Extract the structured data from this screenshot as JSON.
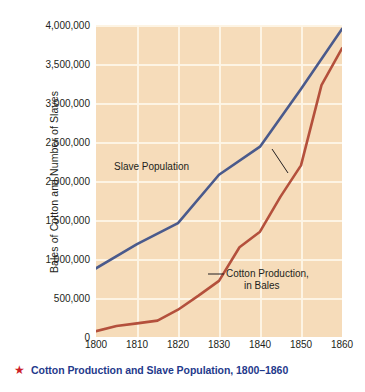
{
  "caption": {
    "star_icon": "★",
    "text": "Cotton Production and Slave Population, 1800–1860"
  },
  "annotations": {
    "slave_label": "Slave Population",
    "cotton_label_line1": "Cotton Production,",
    "cotton_label_line2": "in Bales"
  },
  "colors": {
    "plot_background": "#f6dcba",
    "gridline": "#fdf4e6",
    "slave_line": "#4a5a8c",
    "cotton_line": "#b4503c",
    "caption_text": "#1f3a8c",
    "caption_star": "#cc2027",
    "tick_text": "#231f20"
  },
  "chart_data": {
    "type": "line",
    "title": "Cotton Production and Slave Population, 1800–1860",
    "xlabel": "",
    "ylabel": "Bales of Cotton and Number of Slaves",
    "xlim": [
      1800,
      1860
    ],
    "ylim": [
      0,
      4000000
    ],
    "grid": true,
    "legend": "inline-annotations",
    "x": [
      1800,
      1810,
      1820,
      1830,
      1840,
      1850,
      1860
    ],
    "xticklabels": [
      "1800",
      "1810",
      "1820",
      "1830",
      "1840",
      "1850",
      "1860"
    ],
    "yticks": [
      0,
      500000,
      1000000,
      1500000,
      2000000,
      2500000,
      3000000,
      3500000,
      4000000
    ],
    "yticklabels": [
      "0",
      "500,000",
      "1,000,000",
      "1,500,000",
      "2,000,000",
      "2,500,000",
      "3,000,000",
      "3,500,000",
      "4,000,000"
    ],
    "series": [
      {
        "name": "Slave Population",
        "color": "#4a5a8c",
        "x": [
          1800,
          1810,
          1820,
          1830,
          1840,
          1850,
          1860
        ],
        "values": [
          880000,
          1190000,
          1460000,
          2080000,
          2440000,
          3180000,
          3950000
        ]
      },
      {
        "name": "Cotton Production, in Bales",
        "color": "#b4503c",
        "x": [
          1800,
          1805,
          1810,
          1815,
          1820,
          1825,
          1830,
          1835,
          1840,
          1845,
          1850,
          1855,
          1860
        ],
        "values": [
          75000,
          140000,
          175000,
          210000,
          350000,
          530000,
          720000,
          1150000,
          1350000,
          1800000,
          2200000,
          3230000,
          3700000
        ]
      }
    ]
  }
}
